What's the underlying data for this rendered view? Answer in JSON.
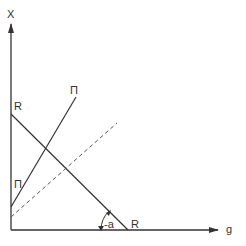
{
  "diagram": {
    "type": "line-diagram",
    "axes": {
      "y_label": "X",
      "x_label": "g"
    },
    "lines": [
      {
        "name": "R",
        "label_start": "R",
        "label_end": "R",
        "style": "solid"
      },
      {
        "name": "Π",
        "label_top": "Π",
        "label_left": "Π",
        "style": "solid"
      },
      {
        "name": "reference",
        "style": "dashed"
      }
    ],
    "angle": {
      "label": "-a"
    },
    "colors": {
      "stroke": "#333333",
      "background": "#ffffff"
    }
  }
}
